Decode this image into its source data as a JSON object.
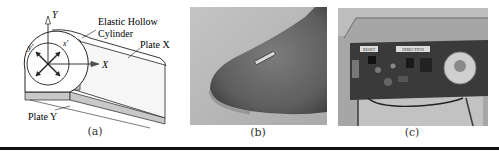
{
  "figure": {
    "panels": [
      {
        "id": "a",
        "caption": "(a)",
        "type": "diagram",
        "labels": {
          "axis_y": "Y",
          "axis_x": "X",
          "axis_y_prime": "y'",
          "axis_x_prime": "x'",
          "elastic_line1": "Elastic Hollow",
          "elastic_line2": "Cylinder",
          "plate_x": "Plate X",
          "plate_y": "Plate Y"
        }
      },
      {
        "id": "b",
        "caption": "(b)",
        "type": "photo",
        "description": "Miniature sensor on fingertip"
      },
      {
        "id": "c",
        "caption": "(c)",
        "type": "photo",
        "description": "Circuit board in transparent enclosure",
        "board_labels": [
          "RESET",
          "DIRECTION"
        ]
      }
    ],
    "colors": {
      "line": "#222222",
      "plate_fill": "#c8c8c8",
      "rule": "#111111"
    }
  }
}
